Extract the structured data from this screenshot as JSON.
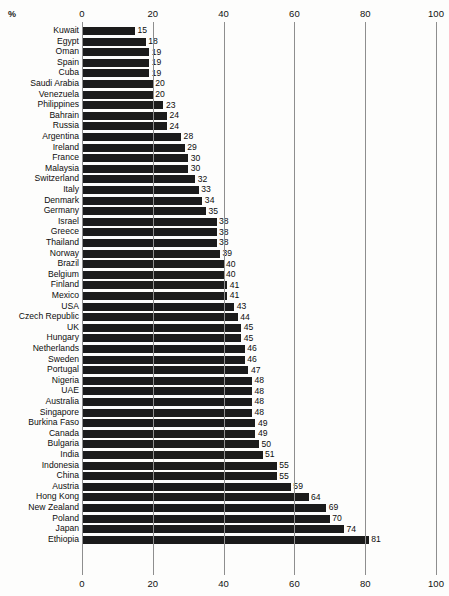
{
  "chart": {
    "type": "bar",
    "orientation": "horizontal",
    "percent_symbol": "%",
    "xlabel": "",
    "ylabel": "",
    "title": "",
    "grid": true,
    "legend": false,
    "xlim": [
      0,
      100
    ],
    "xticks": [
      0,
      20,
      40,
      60,
      80,
      100
    ],
    "xtick_labels": [
      "0",
      "20",
      "40",
      "60",
      "80",
      "100"
    ],
    "bar_color": "#1b1b1b",
    "background_color": "#fdfdfc",
    "gridline_color": "#8e8e8e",
    "axis_top": true,
    "axis_bottom": true
  },
  "chart_data": {
    "type": "bar",
    "title": "",
    "xlabel": "%",
    "ylabel": "",
    "xlim": [
      0,
      100
    ],
    "xticks": [
      0,
      20,
      40,
      60,
      80,
      100
    ],
    "grid": true,
    "legend": false,
    "categories": [
      "Kuwait",
      "Egypt",
      "Oman",
      "Spain",
      "Cuba",
      "Saudi Arabia",
      "Venezuela",
      "Philippines",
      "Bahrain",
      "Russia",
      "Argentina",
      "Ireland",
      "France",
      "Malaysia",
      "Switzerland",
      "Italy",
      "Denmark",
      "Germany",
      "Israel",
      "Greece",
      "Thailand",
      "Norway",
      "Brazil",
      "Belgium",
      "Finland",
      "Mexico",
      "USA",
      "Czech Republic",
      "UK",
      "Hungary",
      "Netherlands",
      "Sweden",
      "Portugal",
      "Nigeria",
      "UAE",
      "Australia",
      "Singapore",
      "Burkina Faso",
      "Canada",
      "Bulgaria",
      "India",
      "Indonesia",
      "China",
      "Austria",
      "Hong Kong",
      "New Zealand",
      "Poland",
      "Japan",
      "Ethiopia"
    ],
    "values": [
      15,
      18,
      19,
      19,
      19,
      20,
      20,
      23,
      24,
      24,
      28,
      29,
      30,
      30,
      32,
      33,
      34,
      35,
      38,
      38,
      38,
      39,
      40,
      40,
      41,
      41,
      43,
      44,
      45,
      45,
      46,
      46,
      47,
      48,
      48,
      48,
      48,
      49,
      49,
      50,
      51,
      55,
      55,
      59,
      64,
      69,
      70,
      74,
      81
    ]
  }
}
